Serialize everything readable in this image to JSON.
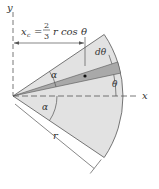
{
  "diagram": {
    "labels": {
      "y_axis": "y",
      "x_axis": "x",
      "xc_symbol": "x",
      "xc_sub": "c",
      "equals": "=",
      "frac_num": "2",
      "frac_den": "3",
      "formula_rest": "r cos θ",
      "d_theta": "dθ",
      "theta": "θ",
      "alpha_top": "α",
      "alpha_bottom": "α",
      "radius": "r"
    },
    "geometry": {
      "half_angle_alpha_deg": 34,
      "element_angle_theta_deg": 12,
      "element_width_dtheta_deg": 6
    },
    "colors": {
      "sector_fill": "#e2e2e2",
      "element_fill": "#a9a9a9",
      "line": "#555555"
    }
  }
}
